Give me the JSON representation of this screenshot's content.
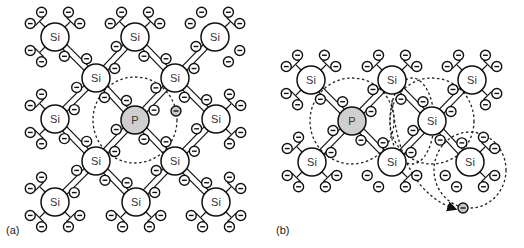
{
  "figure": {
    "panels": [
      {
        "id": "a",
        "label": "(a)",
        "label_pos": [
          6,
          234
        ],
        "atoms": [
          {
            "el": "Si",
            "x": 55,
            "y": 37
          },
          {
            "el": "Si",
            "x": 135,
            "y": 37
          },
          {
            "el": "Si",
            "x": 215,
            "y": 37
          },
          {
            "el": "Si",
            "x": 96,
            "y": 78
          },
          {
            "el": "Si",
            "x": 175,
            "y": 78
          },
          {
            "el": "Si",
            "x": 55,
            "y": 119
          },
          {
            "el": "P",
            "x": 135,
            "y": 120
          },
          {
            "el": "Si",
            "x": 216,
            "y": 119
          },
          {
            "el": "Si",
            "x": 96,
            "y": 161
          },
          {
            "el": "Si",
            "x": 175,
            "y": 161
          },
          {
            "el": "Si",
            "x": 55,
            "y": 202
          },
          {
            "el": "Si",
            "x": 136,
            "y": 202
          },
          {
            "el": "Si",
            "x": 216,
            "y": 202
          }
        ],
        "bonds": [
          [
            0,
            3
          ],
          [
            1,
            3
          ],
          [
            1,
            4
          ],
          [
            2,
            4
          ],
          [
            3,
            5
          ],
          [
            3,
            6
          ],
          [
            4,
            6
          ],
          [
            4,
            7
          ],
          [
            5,
            8
          ],
          [
            6,
            8
          ],
          [
            6,
            9
          ],
          [
            7,
            9
          ],
          [
            8,
            10
          ],
          [
            8,
            11
          ],
          [
            9,
            11
          ],
          [
            9,
            12
          ]
        ],
        "broken_dangling": [
          [
            2,
            "tl"
          ],
          [
            2,
            "br"
          ]
        ],
        "free_electrons": [
          {
            "x": 176,
            "y": 111
          }
        ],
        "orbits": [
          {
            "type": "ellipse",
            "cx": 135,
            "cy": 120,
            "rx": 42,
            "ry": 43
          }
        ]
      },
      {
        "id": "b",
        "label": "(b)",
        "label_pos": [
          276,
          234
        ],
        "atoms": [
          {
            "el": "Si",
            "x": 311,
            "y": 80
          },
          {
            "el": "Si",
            "x": 392,
            "y": 80
          },
          {
            "el": "Si",
            "x": 472,
            "y": 80
          },
          {
            "el": "P",
            "x": 352,
            "y": 121
          },
          {
            "el": "Si",
            "x": 432,
            "y": 121
          },
          {
            "el": "Si",
            "x": 312,
            "y": 162
          },
          {
            "el": "Si",
            "x": 392,
            "y": 162
          },
          {
            "el": "Si",
            "x": 470,
            "y": 162
          }
        ],
        "bonds": [
          [
            0,
            3
          ],
          [
            1,
            3
          ],
          [
            1,
            4
          ],
          [
            2,
            4
          ],
          [
            3,
            5
          ],
          [
            3,
            6
          ],
          [
            4,
            6
          ],
          [
            4,
            7
          ]
        ],
        "broken_dangling": [
          [
            6,
            "bl"
          ],
          [
            7,
            "bl"
          ]
        ],
        "free_electrons": [
          {
            "x": 463,
            "y": 208
          }
        ],
        "orbits": [
          {
            "type": "ellipse",
            "cx": 352,
            "cy": 121,
            "rx": 42,
            "ry": 43
          },
          {
            "type": "ellipse",
            "cx": 412,
            "cy": 121,
            "rx": 22,
            "ry": 43
          },
          {
            "type": "ellipse",
            "cx": 432,
            "cy": 121,
            "rx": 42,
            "ry": 43
          },
          {
            "type": "ellipse",
            "cx": 470,
            "cy": 170,
            "rx": 36,
            "ry": 38
          }
        ],
        "arrow": {
          "from": [
            392,
            100
          ],
          "ctrl": [
            400,
            190
          ],
          "to": [
            455,
            209
          ]
        }
      }
    ]
  }
}
